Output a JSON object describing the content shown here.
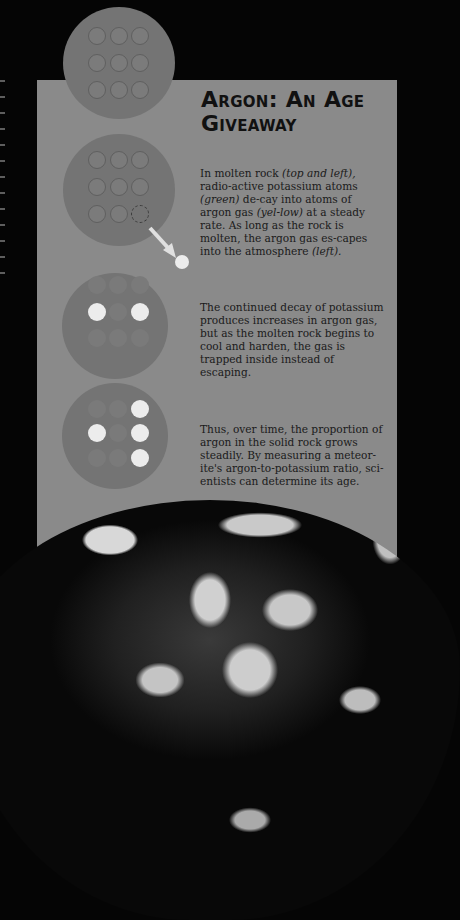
{
  "title": "Argon: An Age Giveaway",
  "paragraphs": [
    {
      "parts": [
        "In molten rock ",
        "(top and left),",
        " radio-active potassium atoms ",
        "(green)",
        " de-cay into atoms of argon gas ",
        "(yel-low)",
        " at a steady rate. As long as the rock is molten, the argon gas es-capes into the atmosphere ",
        "(left)."
      ]
    },
    {
      "text": "The continued decay of potassium produces increases in argon gas, but as the molten rock begins to cool and harden, the gas is trapped inside instead of escaping."
    },
    {
      "text": "Thus, over time, the proportion of argon in the solid rock grows steadily. By measuring a meteor-ite's argon-to-potassium ratio, sci-entists can determine its age."
    }
  ],
  "diagrams": [
    {
      "stage": 1,
      "description": "molten rock, 9 potassium atoms"
    },
    {
      "stage": 2,
      "description": "one atom decays, argon escapes"
    },
    {
      "stage": 3,
      "description": "2 argon atoms trapped"
    },
    {
      "stage": 4,
      "description": "4 argon atoms trapped"
    }
  ],
  "colors": {
    "panel": "#8a8a8a",
    "disc": "#747474",
    "argon": "#ececec",
    "background": "#050505"
  }
}
